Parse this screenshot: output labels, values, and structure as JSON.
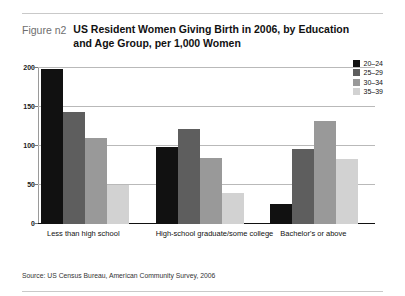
{
  "figure": {
    "label": "Figure n2",
    "title": "US Resident Women Giving Birth in 2006, by Education and Age Group, per 1,000 Women",
    "source": "Source: US Census Bureau, American Community Survey, 2006"
  },
  "colors": {
    "series_20_24": "#111111",
    "series_25_29": "#5e5e5e",
    "series_30_34": "#999999",
    "series_35_39": "#d2d2d2",
    "gridline": "#b9b9b9",
    "axis": "#111111",
    "figure_label": "#6e6e6e"
  },
  "chart_data": {
    "type": "bar",
    "title": "US Resident Women Giving Birth in 2006, by Education and Age Group, per 1,000 Women",
    "xlabel": "",
    "ylabel": "",
    "ylim": [
      0,
      200
    ],
    "yticks": [
      "0",
      "50",
      "100",
      "150",
      "200"
    ],
    "grid": true,
    "legend_position": "top-right",
    "categories": [
      "Less than high school",
      "High-school graduate/some college",
      "Bachelor's or above"
    ],
    "series": [
      {
        "name": "20–24",
        "values": [
          198,
          99,
          25
        ]
      },
      {
        "name": "25–29",
        "values": [
          143,
          122,
          96
        ]
      },
      {
        "name": "30–34",
        "values": [
          110,
          85,
          132
        ]
      },
      {
        "name": "35–39",
        "values": [
          50,
          40,
          83
        ]
      }
    ]
  }
}
